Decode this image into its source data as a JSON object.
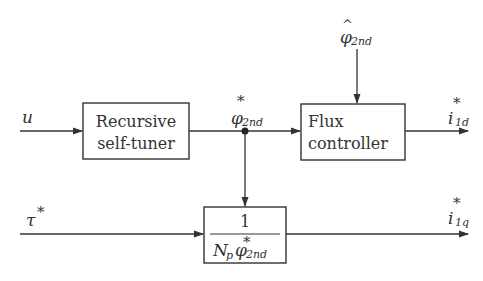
{
  "diagram": {
    "blocks": [
      {
        "id": "recursive-self-tuner",
        "lines": [
          "Recursive",
          "self-tuner"
        ]
      },
      {
        "id": "flux-controller",
        "lines": [
          "Flux",
          "controller"
        ]
      },
      {
        "id": "torque-gain",
        "numerator": "1",
        "denominator": {
          "base": "N",
          "base_sub": "p",
          "symbol": "φ",
          "sup": "*",
          "sub": "2nd"
        }
      }
    ],
    "signals": {
      "u": {
        "symbol": "u"
      },
      "phi_ref": {
        "symbol": "φ",
        "sup": "*",
        "sub": "2nd"
      },
      "phi_hat": {
        "symbol": "φ",
        "hat": "^",
        "sub": "2nd"
      },
      "i1d": {
        "symbol": "i",
        "sup": "*",
        "sub": "1d"
      },
      "tau": {
        "symbol": "τ",
        "sup": "*"
      },
      "i1q": {
        "symbol": "i",
        "sup": "*",
        "sub": "1q"
      }
    },
    "colors": {
      "line": "#333333",
      "background": "#ffffff"
    }
  }
}
